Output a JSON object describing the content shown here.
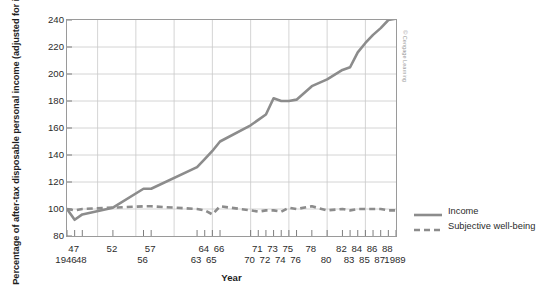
{
  "chart_data": {
    "type": "line",
    "title": "",
    "xlabel": "Year",
    "ylabel": "Percentage of after-tax disposable personal income (adjusted for inflation)",
    "ylim": [
      80,
      240
    ],
    "yticks": [
      80,
      100,
      120,
      140,
      160,
      180,
      200,
      220,
      240
    ],
    "xlim": [
      1946,
      1989
    ],
    "grid": true,
    "legend_position": "right",
    "xtick_labels_top": [
      "47",
      "52",
      "57",
      "64",
      "66",
      "71",
      "73",
      "75",
      "78",
      "82",
      "84",
      "86",
      "88"
    ],
    "xtick_labels_bottom": [
      "1946",
      "48",
      "56",
      "63",
      "65",
      "70",
      "72",
      "74",
      "76",
      "80",
      "83",
      "85",
      "87",
      "1989"
    ],
    "xtick_years_top": [
      1947,
      1952,
      1957,
      1964,
      1966,
      1971,
      1973,
      1975,
      1978,
      1982,
      1984,
      1986,
      1988
    ],
    "xtick_years_bottom": [
      1946,
      1948,
      1956,
      1963,
      1965,
      1970,
      1972,
      1974,
      1976,
      1980,
      1983,
      1985,
      1987,
      1989
    ],
    "x": [
      1946,
      1947,
      1948,
      1952,
      1956,
      1957,
      1963,
      1964,
      1965,
      1966,
      1970,
      1971,
      1972,
      1973,
      1974,
      1975,
      1976,
      1978,
      1980,
      1982,
      1983,
      1984,
      1985,
      1986,
      1987,
      1988,
      1989
    ],
    "series": [
      {
        "name": "Income",
        "style": "solid",
        "color": "#8c8c8c",
        "values": [
          100,
          92,
          96,
          101,
          115,
          115,
          131,
          137,
          143,
          150,
          162,
          166,
          170,
          182,
          180,
          180,
          181,
          191,
          196,
          203,
          205,
          216,
          223,
          229,
          234,
          240,
          241
        ]
      },
      {
        "name": "Subjective well-being",
        "style": "dashed",
        "color": "#8c8c8c",
        "values": [
          100,
          99,
          100,
          101,
          102,
          102,
          100,
          99,
          96,
          102,
          99,
          98,
          99,
          99,
          98,
          101,
          100,
          102,
          99,
          100,
          99,
          100,
          100,
          100,
          100,
          99,
          99
        ]
      }
    ]
  },
  "legend": {
    "items": [
      {
        "label": "Income",
        "style": "solid"
      },
      {
        "label": "Subjective well-being",
        "style": "dashed"
      }
    ]
  },
  "credit": {
    "text": "© Cengage Learning"
  },
  "colors": {
    "line": "#8c8c8c",
    "grid": "#c9c9c9",
    "axis": "#9a9a9a",
    "text": "#2b2b2b"
  }
}
